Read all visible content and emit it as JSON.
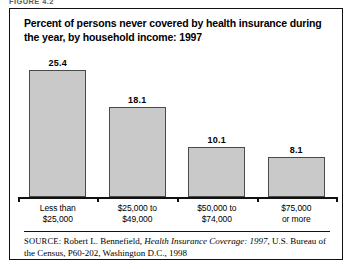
{
  "figure": {
    "caption_cutoff": "FIGURE 4.2",
    "title": "Percent of persons never covered by health insurance during the year, by household income: 1997"
  },
  "source": {
    "label": "SOURCE:",
    "author": "Robert L. Bennefield,",
    "work_italic": "Health Insurance Coverage: 1997",
    "rest": ", U.S. Bureau of the Census, P60-202, Washington D.C., 1998"
  },
  "chart_data": {
    "type": "bar",
    "title": "Percent of persons never covered by health insurance during the year, by household income: 1997",
    "xlabel": "",
    "ylabel": "",
    "ylim": [
      0,
      28
    ],
    "grid": false,
    "legend": "none",
    "categories": [
      "Less than $25,000",
      "$25,000 to $49,000",
      "$50,000 to $74,000",
      "$75,000 or more"
    ],
    "category_lines": [
      [
        "Less than",
        "$25,000"
      ],
      [
        "$25,000 to",
        "$49,000"
      ],
      [
        "$50,000 to",
        "$74,000"
      ],
      [
        "$75,000",
        "or more"
      ]
    ],
    "values": [
      25.4,
      18.1,
      10.1,
      8.1
    ],
    "value_labels": [
      "25.4",
      "18.1",
      "10.1",
      "8.1"
    ],
    "bar_fill": "#c9c9c9",
    "bar_stroke": "#4a4a4a"
  }
}
